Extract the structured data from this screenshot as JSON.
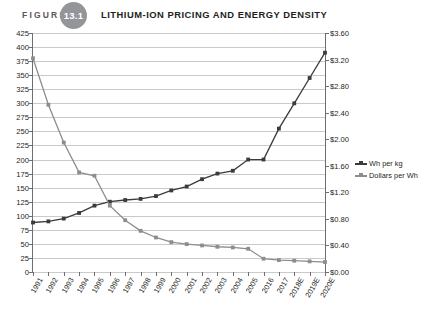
{
  "header": {
    "figure_word": "FIGURE",
    "figure_number": "13.1",
    "title": "LITHIUM-ION PRICING AND ENERGY DENSITY"
  },
  "colors": {
    "badge": "#949599",
    "wh_per_kg": "#3b3a3c",
    "dollars_per_wh": "#8c8d90",
    "grid": "#c9cacc",
    "axis": "#6d6e71"
  },
  "legend": {
    "position": "right",
    "items": [
      {
        "label": "Wh per kg",
        "color": "#3b3a3c"
      },
      {
        "label": "Dollars per Wh",
        "color": "#8c8d90"
      }
    ]
  },
  "chart_data": {
    "type": "line",
    "title": "Lithium-Ion Pricing and Energy Density",
    "xlabel": "",
    "ylabel": "",
    "grid": true,
    "categories": [
      "1991",
      "1992",
      "1993",
      "1994",
      "1995",
      "1996",
      "1997",
      "1998",
      "1999",
      "2000",
      "2001",
      "2002",
      "2003",
      "2004",
      "2005",
      "2016",
      "2017",
      "2018E",
      "2019E",
      "2020E"
    ],
    "y_left": {
      "label": "Wh per kg",
      "ylim": [
        0,
        425
      ],
      "tick_step": 25,
      "ticks": [
        425,
        400,
        375,
        350,
        325,
        300,
        275,
        250,
        225,
        200,
        175,
        150,
        125,
        100,
        75,
        50,
        25,
        0
      ],
      "tick_labels": [
        "425",
        "400",
        "375",
        "350",
        "325",
        "300",
        "275",
        "250",
        "225",
        "200",
        "175",
        "150",
        "125",
        "100",
        "75",
        "50",
        "25",
        "0"
      ]
    },
    "y_right": {
      "label": "Dollars per Wh",
      "ylim": [
        0,
        3.6
      ],
      "tick_step": 0.4,
      "ticks": [
        3.6,
        3.2,
        2.8,
        2.4,
        2.0,
        1.6,
        1.2,
        0.8,
        0.4,
        0.0
      ],
      "tick_labels": [
        "$3.60",
        "$3.20",
        "$2.80",
        "$2.40",
        "$2.00",
        "$1.60",
        "$1.20",
        "$0.80",
        "$0.40",
        "$0.00"
      ]
    },
    "series": [
      {
        "name": "Wh per kg",
        "axis": "left",
        "color": "#3b3a3c",
        "values": [
          88,
          90,
          95,
          105,
          118,
          125,
          128,
          130,
          135,
          145,
          152,
          165,
          175,
          180,
          200,
          200,
          255,
          300,
          345,
          390
        ]
      },
      {
        "name": "Dollars per Wh",
        "axis": "right",
        "color": "#8c8d90",
        "values": [
          3.22,
          2.52,
          1.95,
          1.5,
          1.45,
          1.0,
          0.78,
          0.62,
          0.52,
          0.45,
          0.42,
          0.4,
          0.38,
          0.37,
          0.35,
          0.2,
          0.18,
          0.17,
          0.16,
          0.15
        ]
      }
    ]
  }
}
